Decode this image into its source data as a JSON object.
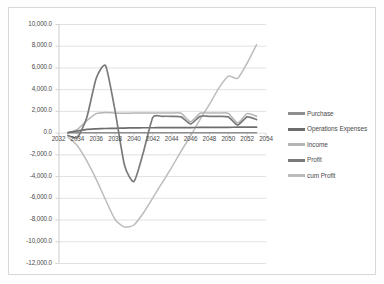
{
  "chart_data": {
    "type": "line",
    "title": "",
    "xlabel": "",
    "ylabel": "",
    "grid": true,
    "legend_position": "right",
    "xlim": [
      2032,
      2054
    ],
    "ylim": [
      -12000,
      10000
    ],
    "x_ticks": [
      "2032",
      "2034",
      "2036",
      "2038",
      "2040",
      "2042",
      "2044",
      "2046",
      "2048",
      "2050",
      "2052",
      "2054"
    ],
    "y_ticks": [
      "10,000.0",
      "8,000.0",
      "6,000.0",
      "4,000.0",
      "2,000.0",
      "0.0",
      "-2,000.0",
      "-4,000.0",
      "-6,000.0",
      "-8,000.0",
      "-10,000.0",
      "-12,000.0"
    ],
    "x": [
      2033,
      2034,
      2035,
      2036,
      2037,
      2038,
      2039,
      2040,
      2041,
      2042,
      2043,
      2044,
      2045,
      2046,
      2047,
      2048,
      2049,
      2050,
      2051,
      2052,
      2053
    ],
    "series": [
      {
        "name": "Purchase",
        "color": "#8e8e8e",
        "values": [
          0,
          0,
          0,
          0,
          0,
          0,
          0,
          0,
          0,
          0,
          0,
          0,
          0,
          0,
          0,
          0,
          0,
          0,
          0,
          0,
          0
        ]
      },
      {
        "name": "Operations Expenses",
        "color": "#6d6d6d",
        "values": [
          0,
          150,
          300,
          350,
          380,
          400,
          420,
          440,
          450,
          450,
          460,
          460,
          470,
          470,
          480,
          480,
          490,
          490,
          500,
          500,
          500
        ]
      },
      {
        "name": "Income",
        "color": "#b5b5b5",
        "values": [
          0,
          300,
          1100,
          1750,
          1850,
          1800,
          1780,
          1800,
          1800,
          1800,
          1800,
          1800,
          1780,
          1000,
          1780,
          1800,
          1800,
          1780,
          900,
          1750,
          1500
        ]
      },
      {
        "name": "Profit",
        "color": "#7a7a7a",
        "values": [
          -250,
          -450,
          1400,
          5000,
          6150,
          2000,
          -3000,
          -4500,
          -1800,
          1400,
          1500,
          1500,
          1450,
          800,
          1500,
          1500,
          1500,
          1450,
          700,
          1450,
          1200
        ]
      },
      {
        "name": "cum Profit",
        "color": "#bcbcbc",
        "values": [
          -400,
          -1200,
          -2600,
          -4300,
          -6200,
          -8000,
          -8700,
          -8500,
          -7400,
          -6000,
          -4600,
          -3200,
          -1700,
          -300,
          1200,
          2600,
          4100,
          5200,
          5000,
          6400,
          8100
        ]
      }
    ]
  },
  "legend": {
    "items": [
      {
        "label": "Purchase"
      },
      {
        "label": "Operations Expenses"
      },
      {
        "label": "Income"
      },
      {
        "label": "Profit"
      },
      {
        "label": "cum Profit"
      }
    ]
  }
}
